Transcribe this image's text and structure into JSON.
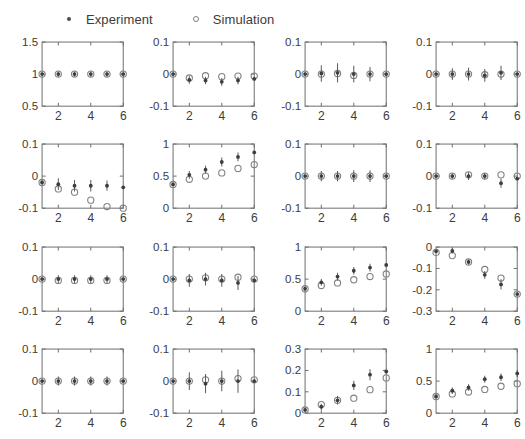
{
  "legend": {
    "entries": [
      {
        "label": "Experiment",
        "marker": "filled-dot-icon",
        "color": "#4a4a4a"
      },
      {
        "label": "Simulation",
        "marker": "open-circle-icon",
        "color": "#7d7d7d"
      }
    ]
  },
  "colors": {
    "experiment": "#3d3d3d",
    "simulation": "#828282",
    "axis": "#6e6e6e",
    "text": "#3c3c3c",
    "background": "#ffffff"
  },
  "chart_data": {
    "type": "scatter",
    "title": "",
    "grid": false,
    "legend_position": "top",
    "layout": {
      "rows": 4,
      "cols": 4
    },
    "shared_x": [
      1,
      2,
      3,
      4,
      5,
      6
    ],
    "xlim": [
      1,
      6
    ],
    "xticks": [
      2,
      4,
      6
    ],
    "xticklabels": [
      "2",
      "4",
      "6"
    ],
    "series_names": [
      "Experiment",
      "Simulation"
    ],
    "panels": [
      {
        "id": "panel-r1c1",
        "row": 1,
        "col": 1,
        "ylim": [
          0.5,
          1.5
        ],
        "yticks": [
          0.5,
          1,
          1.5
        ],
        "yticklabels": [
          "0.5",
          "1",
          "1.5"
        ],
        "series": [
          {
            "name": "Experiment",
            "values": [
              1.0,
              1.0,
              1.0,
              1.0,
              1.0,
              1.0
            ],
            "err": [
              0.0,
              0.04,
              0.04,
              0.04,
              0.04,
              0.0
            ]
          },
          {
            "name": "Simulation",
            "values": [
              1.0,
              1.0,
              1.0,
              1.0,
              1.0,
              1.0
            ]
          }
        ]
      },
      {
        "id": "panel-r1c2",
        "row": 1,
        "col": 2,
        "ylim": [
          -0.1,
          0.1
        ],
        "yticks": [
          -0.1,
          0,
          0.1
        ],
        "yticklabels": [
          "-0.1",
          "0",
          "0.1"
        ],
        "series": [
          {
            "name": "Experiment",
            "values": [
              0.0,
              -0.018,
              -0.02,
              -0.024,
              -0.02,
              -0.015
            ],
            "err": [
              0.0,
              0.012,
              0.012,
              0.012,
              0.012,
              0.0
            ]
          },
          {
            "name": "Simulation",
            "values": [
              0.0,
              -0.012,
              -0.005,
              -0.008,
              -0.006,
              -0.006
            ]
          }
        ]
      },
      {
        "id": "panel-r1c3",
        "row": 1,
        "col": 3,
        "ylim": [
          -0.1,
          0.1
        ],
        "yticks": [
          -0.1,
          0,
          0.1
        ],
        "yticklabels": [
          "-0.1",
          "0",
          "0.1"
        ],
        "series": [
          {
            "name": "Experiment",
            "values": [
              0.0,
              0.002,
              0.004,
              0.0,
              0.0,
              0.0
            ],
            "err": [
              0.0,
              0.026,
              0.03,
              0.026,
              0.022,
              0.0
            ]
          },
          {
            "name": "Simulation",
            "values": [
              0.0,
              0.0,
              0.002,
              -0.004,
              0.0,
              0.0
            ]
          }
        ]
      },
      {
        "id": "panel-r1c4",
        "row": 1,
        "col": 4,
        "ylim": [
          -0.1,
          0.1
        ],
        "yticks": [
          -0.1,
          0,
          0.1
        ],
        "yticklabels": [
          "-0.1",
          "0",
          "0.1"
        ],
        "series": [
          {
            "name": "Experiment",
            "values": [
              0.0,
              0.0,
              0.0,
              -0.004,
              0.004,
              0.0
            ],
            "err": [
              0.0,
              0.018,
              0.02,
              0.02,
              0.022,
              0.0
            ]
          },
          {
            "name": "Simulation",
            "values": [
              0.0,
              0.0,
              0.0,
              -0.002,
              0.0,
              0.0
            ]
          }
        ]
      },
      {
        "id": "panel-r2c1",
        "row": 2,
        "col": 1,
        "ylim": [
          -0.1,
          0.1
        ],
        "yticks": [
          -0.1,
          0,
          0.1
        ],
        "yticklabels": [
          "-0.1",
          "0",
          "0.1"
        ],
        "series": [
          {
            "name": "Experiment",
            "values": [
              -0.02,
              -0.025,
              -0.03,
              -0.03,
              -0.03,
              -0.035
            ],
            "err": [
              0.0,
              0.018,
              0.018,
              0.018,
              0.016,
              0.0
            ]
          },
          {
            "name": "Simulation",
            "values": [
              -0.02,
              -0.04,
              -0.05,
              -0.075,
              -0.095,
              -0.1
            ]
          }
        ]
      },
      {
        "id": "panel-r2c2",
        "row": 2,
        "col": 2,
        "ylim": [
          0,
          1
        ],
        "yticks": [
          0,
          0.5,
          1
        ],
        "yticklabels": [
          "0",
          "0.5",
          "1"
        ],
        "series": [
          {
            "name": "Experiment",
            "values": [
              0.37,
              0.52,
              0.6,
              0.72,
              0.8,
              0.87
            ],
            "err": [
              0.0,
              0.06,
              0.06,
              0.07,
              0.07,
              0.0
            ]
          },
          {
            "name": "Simulation",
            "values": [
              0.37,
              0.45,
              0.5,
              0.55,
              0.62,
              0.68
            ]
          }
        ]
      },
      {
        "id": "panel-r2c3",
        "row": 2,
        "col": 3,
        "ylim": [
          -0.1,
          0.1
        ],
        "yticks": [
          -0.1,
          0,
          0.1
        ],
        "yticklabels": [
          "-0.1",
          "0",
          "0.1"
        ],
        "series": [
          {
            "name": "Experiment",
            "values": [
              0.0,
              0.0,
              0.0,
              0.0,
              0.0,
              0.0
            ],
            "err": [
              0.0,
              0.016,
              0.016,
              0.018,
              0.018,
              0.0
            ]
          },
          {
            "name": "Simulation",
            "values": [
              0.0,
              0.0,
              0.0,
              0.0,
              0.0,
              0.0
            ]
          }
        ]
      },
      {
        "id": "panel-r2c4",
        "row": 2,
        "col": 4,
        "ylim": [
          -0.1,
          0.1
        ],
        "yticks": [
          -0.1,
          0,
          0.1
        ],
        "yticklabels": [
          "-0.1",
          "0",
          "0.1"
        ],
        "series": [
          {
            "name": "Experiment",
            "values": [
              0.0,
              0.0,
              0.0,
              0.0,
              -0.022,
              -0.008
            ],
            "err": [
              0.0,
              0.008,
              0.012,
              0.01,
              0.014,
              0.0
            ]
          },
          {
            "name": "Simulation",
            "values": [
              0.0,
              0.0,
              0.004,
              0.0,
              0.004,
              0.0
            ]
          }
        ]
      },
      {
        "id": "panel-r3c1",
        "row": 3,
        "col": 1,
        "ylim": [
          -0.1,
          0.1
        ],
        "yticks": [
          -0.1,
          0,
          0.1
        ],
        "yticklabels": [
          "-0.1",
          "0",
          "0.1"
        ],
        "series": [
          {
            "name": "Experiment",
            "values": [
              0.0,
              0.0,
              0.0,
              0.0,
              0.0,
              0.0
            ],
            "err": [
              0.0,
              0.012,
              0.012,
              0.012,
              0.012,
              0.0
            ]
          },
          {
            "name": "Simulation",
            "values": [
              0.0,
              -0.004,
              -0.004,
              -0.004,
              -0.004,
              0.0
            ]
          }
        ]
      },
      {
        "id": "panel-r3c2",
        "row": 3,
        "col": 2,
        "ylim": [
          -0.1,
          0.1
        ],
        "yticks": [
          -0.1,
          0,
          0.1
        ],
        "yticklabels": [
          "-0.1",
          "0",
          "0.1"
        ],
        "series": [
          {
            "name": "Experiment",
            "values": [
              0.0,
              -0.004,
              0.0,
              -0.004,
              -0.012,
              -0.004
            ],
            "err": [
              0.0,
              0.02,
              0.02,
              0.02,
              0.022,
              0.0
            ]
          },
          {
            "name": "Simulation",
            "values": [
              0.0,
              0.0,
              0.004,
              0.0,
              0.006,
              0.0
            ]
          }
        ]
      },
      {
        "id": "panel-r3c3",
        "row": 3,
        "col": 3,
        "ylim": [
          0,
          1
        ],
        "yticks": [
          0,
          0.5,
          1
        ],
        "yticklabels": [
          "0",
          "0.5",
          "1"
        ],
        "series": [
          {
            "name": "Experiment",
            "values": [
              0.35,
              0.45,
              0.54,
              0.63,
              0.68,
              0.72
            ],
            "err": [
              0.0,
              0.05,
              0.06,
              0.06,
              0.06,
              0.0
            ]
          },
          {
            "name": "Simulation",
            "values": [
              0.35,
              0.4,
              0.44,
              0.49,
              0.54,
              0.58
            ]
          }
        ]
      },
      {
        "id": "panel-r3c4",
        "row": 3,
        "col": 4,
        "ylim": [
          -0.3,
          0
        ],
        "yticks": [
          -0.3,
          -0.2,
          -0.1,
          0
        ],
        "yticklabels": [
          "-0.3",
          "-0.2",
          "-0.1",
          "0"
        ],
        "series": [
          {
            "name": "Experiment",
            "values": [
              -0.02,
              -0.018,
              -0.07,
              -0.13,
              -0.175,
              -0.22
            ],
            "err": [
              0.0,
              0.012,
              0.012,
              0.018,
              0.024,
              0.0
            ]
          },
          {
            "name": "Simulation",
            "values": [
              -0.025,
              -0.04,
              -0.07,
              -0.105,
              -0.145,
              -0.22
            ]
          }
        ]
      },
      {
        "id": "panel-r4c1",
        "row": 4,
        "col": 1,
        "ylim": [
          -0.1,
          0.1
        ],
        "yticks": [
          -0.1,
          0,
          0.1
        ],
        "yticklabels": [
          "-0.1",
          "0",
          "0.1"
        ],
        "series": [
          {
            "name": "Experiment",
            "values": [
              0.0,
              0.0,
              0.0,
              0.0,
              0.0,
              0.0
            ],
            "err": [
              0.0,
              0.014,
              0.014,
              0.014,
              0.014,
              0.0
            ]
          },
          {
            "name": "Simulation",
            "values": [
              0.0,
              0.0,
              0.0,
              0.0,
              0.0,
              0.0
            ]
          }
        ]
      },
      {
        "id": "panel-r4c2",
        "row": 4,
        "col": 2,
        "ylim": [
          -0.1,
          0.1
        ],
        "yticks": [
          -0.1,
          0,
          0.1
        ],
        "yticklabels": [
          "-0.1",
          "0",
          "0.1"
        ],
        "series": [
          {
            "name": "Experiment",
            "values": [
              0.0,
              0.0,
              -0.008,
              0.0,
              0.0,
              0.0
            ],
            "err": [
              0.0,
              0.028,
              0.03,
              0.032,
              0.036,
              0.0
            ]
          },
          {
            "name": "Simulation",
            "values": [
              0.0,
              0.0,
              0.004,
              0.0,
              0.008,
              0.004
            ]
          }
        ]
      },
      {
        "id": "panel-r4c3",
        "row": 4,
        "col": 3,
        "ylim": [
          0,
          0.3
        ],
        "yticks": [
          0,
          0.1,
          0.2,
          0.3
        ],
        "yticklabels": [
          "0",
          "0.1",
          "0.2",
          "0.3"
        ],
        "series": [
          {
            "name": "Experiment",
            "values": [
              0.015,
              0.03,
              0.06,
              0.13,
              0.18,
              0.195
            ],
            "err": [
              0.0,
              0.014,
              0.02,
              0.022,
              0.026,
              0.0
            ]
          },
          {
            "name": "Simulation",
            "values": [
              0.015,
              0.04,
              0.06,
              0.07,
              0.11,
              0.165
            ]
          }
        ]
      },
      {
        "id": "panel-r4c4",
        "row": 4,
        "col": 4,
        "ylim": [
          0,
          1
        ],
        "yticks": [
          0,
          0.5,
          1
        ],
        "yticklabels": [
          "0",
          "0.5",
          "1"
        ],
        "series": [
          {
            "name": "Experiment",
            "values": [
              0.26,
              0.35,
              0.4,
              0.53,
              0.56,
              0.62
            ],
            "err": [
              0.0,
              0.05,
              0.05,
              0.055,
              0.06,
              0.055
            ]
          },
          {
            "name": "Simulation",
            "values": [
              0.26,
              0.3,
              0.33,
              0.37,
              0.42,
              0.46
            ]
          }
        ]
      }
    ]
  }
}
